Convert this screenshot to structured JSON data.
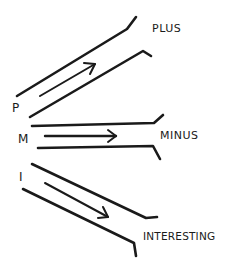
{
  "diagram": {
    "channels": [
      {
        "letter": "P",
        "label": "PLUS",
        "direction": "up"
      },
      {
        "letter": "M",
        "label": "MINUS",
        "direction": "flat"
      },
      {
        "letter": "I",
        "label": "INTERESTING",
        "direction": "down"
      }
    ],
    "colors": {
      "ink": "#1a1a1a",
      "background": "#ffffff"
    }
  }
}
